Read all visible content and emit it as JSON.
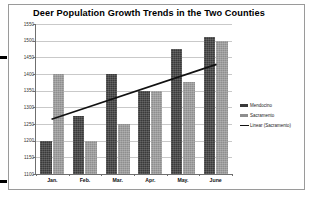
{
  "chart_data": {
    "type": "bar",
    "title": "Deer Population Growth Trends in the Two Counties",
    "xlabel": "",
    "ylabel": "",
    "categories": [
      "Jan.",
      "Feb.",
      "Mar.",
      "Apr.",
      "May.",
      "June"
    ],
    "series": [
      {
        "name": "Mendocino",
        "values": [
          1200,
          1275,
          1400,
          1350,
          1475,
          1510
        ]
      },
      {
        "name": "Sacramento",
        "values": [
          1400,
          1200,
          1250,
          1350,
          1375,
          1500
        ]
      }
    ],
    "trendline": {
      "name": "Linear (Sacramento)",
      "start_value": 1265,
      "end_value": 1428
    },
    "ylim": [
      1100,
      1550
    ],
    "ytick_step": 50,
    "yticks": [
      1550,
      1500,
      1450,
      1400,
      1350,
      1300,
      1250,
      1200,
      1150,
      1100
    ],
    "grid": true,
    "legend_position": "right",
    "legend": [
      {
        "label": "Mendocino",
        "marker": "bar-swatch",
        "color": "#3a3a3a"
      },
      {
        "label": "Sacramento",
        "marker": "bar-swatch",
        "color": "#8e8e8e"
      },
      {
        "label": "Linear (Sacramento)",
        "marker": "line-swatch",
        "color": "#111111"
      }
    ]
  },
  "colors": {
    "mendocino": "#3a3a3a",
    "sacramento": "#8e8e8e",
    "trendline": "#111111",
    "grid": "#c9c9c9",
    "axis": "#6f6f6f",
    "frame": "#9a9a9a",
    "background": "#ffffff"
  }
}
